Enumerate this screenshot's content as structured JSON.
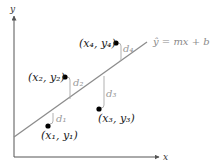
{
  "diagram": {
    "axes": {
      "x_label": "x",
      "y_label": "y"
    },
    "regression_line": {
      "label": "ŷ = mx + b",
      "color": "#8c8c8c"
    },
    "points": [
      {
        "id": "p1",
        "label": "(x₁, y₁)",
        "residual_label": "d₁"
      },
      {
        "id": "p2",
        "label": "(x₂, y₂)",
        "residual_label": "d₂"
      },
      {
        "id": "p3",
        "label": "(x₃, y₃)",
        "residual_label": "d₃"
      },
      {
        "id": "p4",
        "label": "(x₄, y₄)",
        "residual_label": "d₄"
      }
    ],
    "colors": {
      "axes": "#555555",
      "points": "#000000",
      "residuals": "#a0a0a0",
      "line": "#8c8c8c"
    }
  }
}
